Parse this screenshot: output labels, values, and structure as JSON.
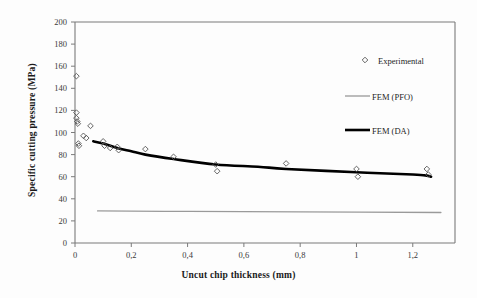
{
  "chart_data": {
    "type": "scatter",
    "title": "",
    "xlabel": "Uncut chip thickness  (mm)",
    "ylabel": "Specific cutting pressure  (MPa)",
    "xlim": [
      0,
      1.35
    ],
    "ylim": [
      0,
      200
    ],
    "xticks": [
      0,
      0.2,
      0.4,
      0.6,
      0.8,
      1,
      1.2
    ],
    "xtick_labels": [
      "0",
      "0,2",
      "0,4",
      "0,6",
      "0,8",
      "1",
      "1,2"
    ],
    "yticks": [
      0,
      20,
      40,
      60,
      80,
      100,
      120,
      140,
      160,
      180,
      200
    ],
    "ytick_labels": [
      "0",
      "20",
      "40",
      "60",
      "80",
      "100",
      "120",
      "140",
      "160",
      "180",
      "200"
    ],
    "grid": false,
    "legend_position": "upper right",
    "series": [
      {
        "name": "Experimental",
        "type": "scatter",
        "marker": "open-diamond",
        "color": "#555555",
        "points": [
          [
            0.005,
            151
          ],
          [
            0.005,
            118
          ],
          [
            0.005,
            113
          ],
          [
            0.008,
            110
          ],
          [
            0.01,
            108
          ],
          [
            0.012,
            90
          ],
          [
            0.014,
            88
          ],
          [
            0.03,
            97
          ],
          [
            0.04,
            95
          ],
          [
            0.055,
            106
          ],
          [
            0.1,
            92
          ],
          [
            0.105,
            88
          ],
          [
            0.125,
            86
          ],
          [
            0.15,
            87
          ],
          [
            0.155,
            84
          ],
          [
            0.25,
            85
          ],
          [
            0.35,
            78
          ],
          [
            0.5,
            71
          ],
          [
            0.505,
            65
          ],
          [
            0.75,
            72
          ],
          [
            1.0,
            67
          ],
          [
            1.005,
            60
          ],
          [
            1.25,
            67
          ],
          [
            1.255,
            62
          ]
        ]
      },
      {
        "name": "FEM (PFO)",
        "type": "line",
        "color": "#9a9a9a",
        "width": 1.3,
        "points": [
          [
            0.08,
            29
          ],
          [
            0.4,
            28.6
          ],
          [
            0.8,
            28.2
          ],
          [
            1.3,
            27.6
          ]
        ]
      },
      {
        "name": "FEM (DA)",
        "type": "line",
        "color": "#000000",
        "width": 2.6,
        "points": [
          [
            0.065,
            92
          ],
          [
            0.1,
            90
          ],
          [
            0.15,
            86
          ],
          [
            0.2,
            83
          ],
          [
            0.25,
            80
          ],
          [
            0.35,
            76
          ],
          [
            0.5,
            71
          ],
          [
            0.65,
            69
          ],
          [
            0.75,
            67
          ],
          [
            1.0,
            64
          ],
          [
            1.2,
            62
          ],
          [
            1.25,
            61
          ],
          [
            1.265,
            60
          ]
        ]
      }
    ],
    "legend_entries": [
      {
        "label": "Experimental",
        "marker": "open-diamond",
        "color": "#555555"
      },
      {
        "label": "FEM (PFO)",
        "marker": "line-thin",
        "color": "#9a9a9a"
      },
      {
        "label": "FEM (DA)",
        "marker": "line-thick",
        "color": "#000000"
      }
    ]
  }
}
